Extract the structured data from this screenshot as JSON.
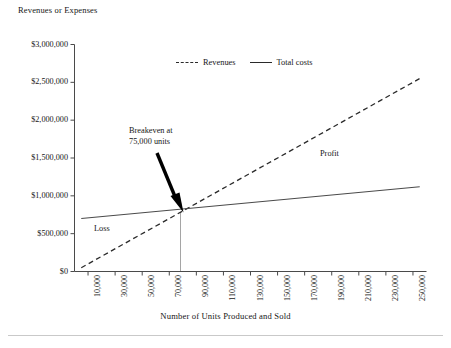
{
  "chart_data": {
    "type": "line",
    "title": "",
    "ylabel": "Revenues or Expenses",
    "xlabel": "Number of Units Produced and Sold",
    "grid": false,
    "legend_position": "top-center-inside",
    "xlim": [
      0,
      260000
    ],
    "ylim": [
      0,
      3000000
    ],
    "x_tick_labels": [
      "10,000",
      "30,000",
      "50,000",
      "70,000",
      "90,000",
      "110,000",
      "130,000",
      "150,000",
      "170,000",
      "190,000",
      "210,000",
      "230,000",
      "250,000"
    ],
    "x_tick_values": [
      10000,
      30000,
      50000,
      70000,
      90000,
      110000,
      130000,
      150000,
      170000,
      190000,
      210000,
      230000,
      250000
    ],
    "y_tick_labels": [
      "$0",
      "$500,000",
      "$1,000,000",
      "$1,500,000",
      "$2,000,000",
      "$2,500,000",
      "$3,000,000"
    ],
    "y_tick_values": [
      0,
      500000,
      1000000,
      1500000,
      2000000,
      2500000,
      3000000
    ],
    "series": [
      {
        "name": "Revenues",
        "style": "dashed",
        "color": "#2a2a2a",
        "x": [
          5000,
          255000
        ],
        "values": [
          50000,
          2550000
        ]
      },
      {
        "name": "Total costs",
        "style": "solid",
        "color": "#4a4a4a",
        "x": [
          5000,
          255000
        ],
        "values": [
          700000,
          1120000
        ]
      }
    ],
    "annotations": [
      {
        "name": "breakeven",
        "text_line1": "Breakeven at",
        "text_line2": "75,000 units",
        "arrow": true,
        "point_x": 75000,
        "point_y": 750000
      },
      {
        "name": "loss",
        "text": "Loss"
      },
      {
        "name": "profit",
        "text": "Profit"
      }
    ],
    "legend_entries": [
      {
        "label": "Revenues",
        "style": "dashed"
      },
      {
        "label": "Total costs",
        "style": "solid"
      }
    ]
  },
  "colors": {
    "background": "#ffffff",
    "axis": "#4a4a4a",
    "text": "#161616",
    "revenues_line": "#2a2a2a",
    "costs_line": "#4a4a4a",
    "arrow": "#000000",
    "rule": "#c9c9c9"
  }
}
